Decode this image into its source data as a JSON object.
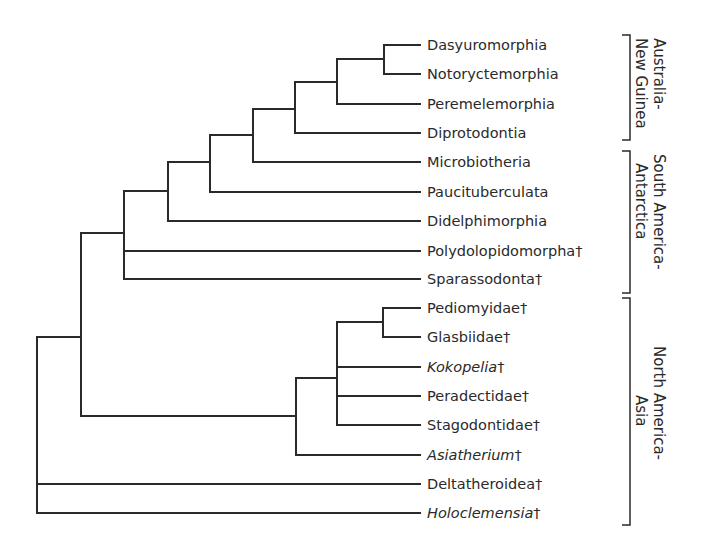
{
  "diagram": {
    "type": "cladogram",
    "line_color": "#2a2a2a",
    "leaves": [
      {
        "name": "Dasyuromorphia",
        "extinct": "",
        "italic": false,
        "y": 45
      },
      {
        "name": "Notoryctemorphia",
        "extinct": "",
        "italic": false,
        "y": 74
      },
      {
        "name": "Peremelemorphia",
        "extinct": "",
        "italic": false,
        "y": 104
      },
      {
        "name": "Diprotodontia",
        "extinct": "",
        "italic": false,
        "y": 133
      },
      {
        "name": "Microbiotheria",
        "extinct": "",
        "italic": false,
        "y": 162
      },
      {
        "name": "Paucituberculata",
        "extinct": "",
        "italic": false,
        "y": 192
      },
      {
        "name": "Didelphimorphia",
        "extinct": "",
        "italic": false,
        "y": 221
      },
      {
        "name": "Polydolopidomorpha",
        "extinct": "†",
        "italic": false,
        "y": 251
      },
      {
        "name": "Sparassodonta",
        "extinct": "†",
        "italic": false,
        "y": 279
      },
      {
        "name": "Pediomyidae",
        "extinct": "†",
        "italic": false,
        "y": 308
      },
      {
        "name": "Glasbiidae",
        "extinct": "†",
        "italic": false,
        "y": 337
      },
      {
        "name": "Kokopelia",
        "extinct": "†",
        "italic": true,
        "y": 367
      },
      {
        "name": "Peradectidae",
        "extinct": "†",
        "italic": false,
        "y": 396
      },
      {
        "name": "Stagodontidae",
        "extinct": "†",
        "italic": false,
        "y": 425
      },
      {
        "name": "Asiatherium",
        "extinct": "†",
        "italic": true,
        "y": 455
      },
      {
        "name": "Deltatheroidea",
        "extinct": "†",
        "italic": false,
        "y": 484
      },
      {
        "name": "Holoclemensia",
        "extinct": "†",
        "italic": true,
        "y": 513
      }
    ],
    "regions": [
      {
        "line1": "Australia-",
        "line2": "New Guinea",
        "top": 35,
        "bottom": 140
      },
      {
        "line1": "South America-",
        "line2": "Antarctica",
        "top": 151,
        "bottom": 293
      },
      {
        "line1": "North America-",
        "line2": "Asia",
        "top": 298,
        "bottom": 525
      }
    ]
  }
}
